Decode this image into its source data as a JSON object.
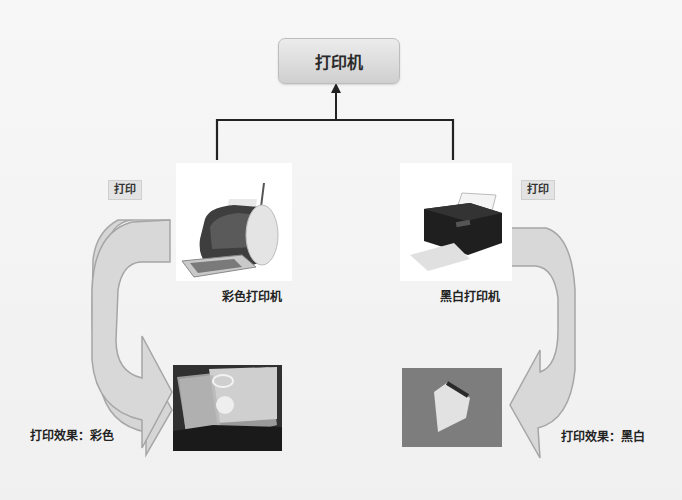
{
  "diagram": {
    "root": {
      "label": "打印机"
    },
    "branches": [
      {
        "id": "color",
        "printer_label": "彩色打印机",
        "printer_icon": "color-inkjet-printer-icon",
        "action_tag": "打印",
        "result_label": "打印效果：彩色",
        "result_image": "color-photo-print"
      },
      {
        "id": "bw",
        "printer_label": "黑白打印机",
        "printer_icon": "black-printer-icon",
        "action_tag": "打印",
        "result_label": "打印效果：黑白",
        "result_image": "grayscale-photo-print"
      }
    ]
  },
  "colors": {
    "background": "#f4f4f4",
    "node_fill_top": "#ececec",
    "node_fill_bottom": "#cfcfcf",
    "connector": "#222222",
    "curved_arrow_fill": "#d6d6d6",
    "curved_arrow_stroke": "#a8a8a8"
  }
}
